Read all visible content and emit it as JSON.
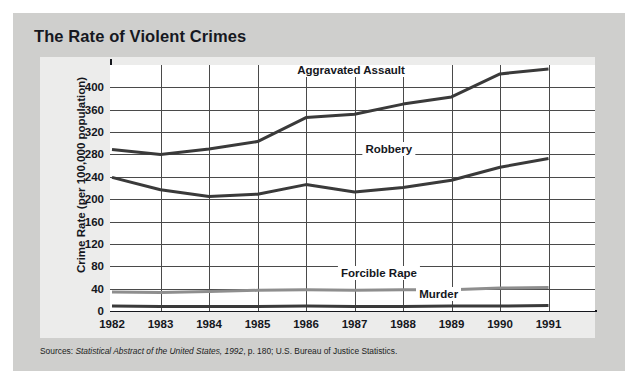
{
  "card": {
    "title": "The Rate of Violent Crimes",
    "background_color": "#cfcfcd",
    "panel_color": "#ececeb"
  },
  "source": {
    "prefix": "Sources: ",
    "italic_part": "Statistical Abstract of the United States, 1992",
    "suffix": ", p. 180; U.S. Bureau of Justice Statistics."
  },
  "chart_data": {
    "type": "line",
    "title": "The Rate of Violent Crimes",
    "xlabel": "",
    "ylabel": "Crime Rate (per 100,000 population)",
    "x": [
      1982,
      1983,
      1984,
      1985,
      1986,
      1987,
      1988,
      1989,
      1990,
      1991
    ],
    "xtick_labels": [
      "1982",
      "1983",
      "1984",
      "1985",
      "1986",
      "1987",
      "1988",
      "1989",
      "1990",
      "1991"
    ],
    "ytick_labels": [
      "400",
      "360",
      "320",
      "280",
      "240",
      "200",
      "160",
      "120",
      "80",
      "40",
      "0"
    ],
    "yticks": [
      400,
      360,
      320,
      280,
      240,
      200,
      160,
      120,
      80,
      40,
      0
    ],
    "ylim": [
      0,
      440
    ],
    "grid": true,
    "legend_position": "inline-annotations",
    "series": [
      {
        "name": "Aggravated Assault",
        "color": "#3a3a3a",
        "values": [
          289,
          280,
          290,
          303,
          346,
          352,
          370,
          383,
          424,
          433
        ],
        "label_x": 1988.1,
        "label_y": 430
      },
      {
        "name": "Robbery",
        "color": "#3a3a3a",
        "values": [
          239,
          217,
          205,
          209,
          226,
          213,
          221,
          234,
          257,
          273
        ],
        "label_x": 1988.25,
        "label_y": 288
      },
      {
        "name": "Forcible Rape",
        "color": "#8e8e8e",
        "values": [
          34,
          33,
          35,
          37,
          38,
          37,
          38,
          38,
          41,
          42
        ],
        "label_x": 1988.35,
        "label_y": 66
      },
      {
        "name": "Murder",
        "color": "#3a3a3a",
        "values": [
          9,
          8,
          8,
          8,
          9,
          8,
          8,
          9,
          9,
          10
        ],
        "label_x": 1989.2,
        "label_y": 28
      }
    ]
  }
}
